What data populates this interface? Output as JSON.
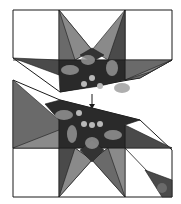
{
  "diagram": {
    "title": "",
    "colors": {
      "background": "#ffffff",
      "outline": "#1a1a1a",
      "light_gray": "#8a8a8a",
      "mid_gray": "#6a6a6a",
      "dark_gray": "#4a4a4a",
      "center_dark": "#2a2a2a",
      "feather": "#9a9a9a",
      "berry": "#b8b8b8"
    },
    "arrow": {
      "direction": "down"
    }
  }
}
